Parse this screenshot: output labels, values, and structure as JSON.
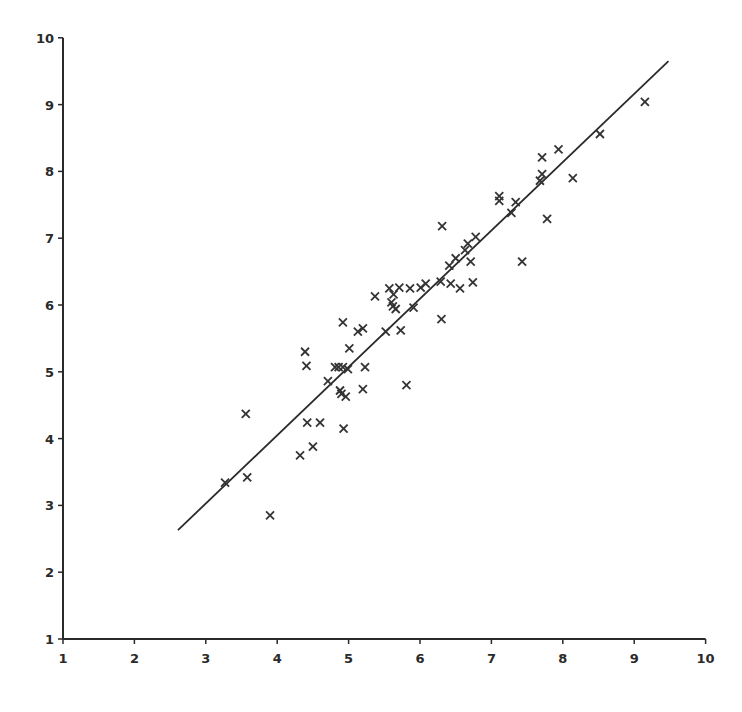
{
  "chart_data": {
    "type": "scatter",
    "title": "",
    "xlabel": "",
    "ylabel": "",
    "xlim": [
      1,
      10
    ],
    "ylim": [
      1,
      10
    ],
    "grid": false,
    "legend": null,
    "marker": "x",
    "x_ticks": [
      "1",
      "2",
      "3",
      "4",
      "5",
      "6",
      "7",
      "8",
      "9",
      "10"
    ],
    "y_ticks": [
      "1",
      "2",
      "3",
      "4",
      "5",
      "6",
      "7",
      "8",
      "9",
      "10"
    ],
    "series": [
      {
        "name": "observations",
        "points": [
          [
            3.27,
            3.34
          ],
          [
            3.56,
            4.37
          ],
          [
            3.58,
            3.42
          ],
          [
            3.9,
            2.85
          ],
          [
            4.32,
            3.75
          ],
          [
            4.39,
            5.3
          ],
          [
            4.41,
            5.09
          ],
          [
            4.42,
            4.24
          ],
          [
            4.5,
            3.88
          ],
          [
            4.6,
            4.24
          ],
          [
            4.71,
            4.86
          ],
          [
            4.81,
            5.07
          ],
          [
            4.86,
            5.07
          ],
          [
            4.88,
            4.72
          ],
          [
            4.9,
            4.67
          ],
          [
            4.92,
            5.07
          ],
          [
            4.92,
            5.74
          ],
          [
            4.93,
            4.15
          ],
          [
            4.96,
            4.63
          ],
          [
            4.99,
            5.04
          ],
          [
            5.01,
            5.35
          ],
          [
            5.13,
            5.6
          ],
          [
            5.2,
            5.65
          ],
          [
            5.2,
            4.74
          ],
          [
            5.23,
            5.07
          ],
          [
            5.37,
            6.13
          ],
          [
            5.52,
            5.6
          ],
          [
            5.57,
            6.25
          ],
          [
            5.6,
            6.04
          ],
          [
            5.62,
            5.98
          ],
          [
            5.63,
            6.16
          ],
          [
            5.66,
            5.94
          ],
          [
            5.71,
            6.26
          ],
          [
            5.73,
            5.62
          ],
          [
            5.81,
            4.8
          ],
          [
            5.86,
            6.25
          ],
          [
            5.91,
            5.96
          ],
          [
            6.01,
            6.26
          ],
          [
            6.08,
            6.32
          ],
          [
            6.29,
            6.35
          ],
          [
            6.3,
            5.79
          ],
          [
            6.31,
            7.18
          ],
          [
            6.41,
            6.59
          ],
          [
            6.43,
            6.32
          ],
          [
            6.5,
            6.7
          ],
          [
            6.56,
            6.25
          ],
          [
            6.63,
            6.82
          ],
          [
            6.67,
            6.92
          ],
          [
            6.71,
            6.65
          ],
          [
            6.74,
            6.34
          ],
          [
            6.78,
            7.02
          ],
          [
            7.11,
            7.56
          ],
          [
            7.11,
            7.63
          ],
          [
            7.28,
            7.38
          ],
          [
            7.34,
            7.54
          ],
          [
            7.43,
            6.65
          ],
          [
            7.68,
            7.86
          ],
          [
            7.71,
            7.96
          ],
          [
            7.71,
            8.21
          ],
          [
            7.78,
            7.29
          ],
          [
            7.94,
            8.33
          ],
          [
            8.14,
            7.9
          ],
          [
            8.52,
            8.56
          ],
          [
            9.15,
            9.04
          ]
        ]
      }
    ],
    "fit_line": {
      "name": "regression line",
      "start": [
        2.61,
        2.63
      ],
      "end": [
        9.48,
        9.65
      ]
    }
  },
  "axes": {
    "x_tick_labels": [
      "1",
      "2",
      "3",
      "4",
      "5",
      "6",
      "7",
      "8",
      "9",
      "10"
    ],
    "y_tick_labels": [
      "1",
      "2",
      "3",
      "4",
      "5",
      "6",
      "7",
      "8",
      "9",
      "10"
    ]
  }
}
